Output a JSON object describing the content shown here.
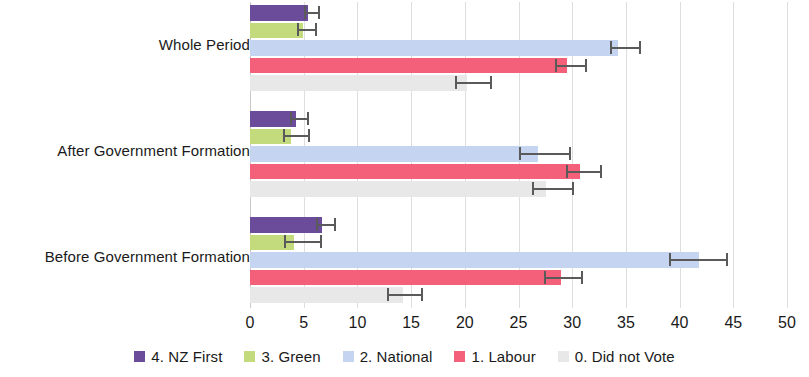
{
  "chart_data": {
    "type": "bar",
    "orientation": "horizontal",
    "title": "",
    "xlabel": "",
    "ylabel": "",
    "xlim": [
      0,
      50
    ],
    "ylim": null,
    "xticks": [
      0,
      5,
      10,
      15,
      20,
      25,
      30,
      35,
      40,
      45,
      50
    ],
    "xtick_labels": [
      "0",
      "5",
      "10",
      "15",
      "20",
      "25",
      "30",
      "35",
      "40",
      "45",
      "50"
    ],
    "grid": true,
    "grid_axis": "x",
    "legend_position": "bottom",
    "categories": [
      "Whole Period",
      "After Government Formation",
      "Before Government Formation"
    ],
    "series": [
      {
        "name": "4. NZ First",
        "color": "#6B4C9A",
        "values": [
          5.4,
          4.3,
          6.7
        ],
        "err_low": [
          5.0,
          3.7,
          6.1
        ],
        "err_high": [
          6.5,
          5.5,
          8.0
        ]
      },
      {
        "name": "3. Green",
        "color": "#C3DB7C",
        "values": [
          4.9,
          3.8,
          4.1
        ],
        "err_low": [
          4.4,
          3.1,
          3.2
        ],
        "err_high": [
          6.2,
          5.6,
          6.7
        ]
      },
      {
        "name": "2. National",
        "color": "#C5D4F0",
        "values": [
          34.3,
          26.8,
          41.8
        ],
        "err_low": [
          33.5,
          25.0,
          39.0
        ],
        "err_high": [
          36.4,
          29.9,
          44.5
        ]
      },
      {
        "name": "1. Labour",
        "color": "#F4607A",
        "values": [
          29.5,
          30.7,
          29.0
        ],
        "err_low": [
          28.4,
          29.4,
          27.4
        ],
        "err_high": [
          31.4,
          32.8,
          31.0
        ]
      },
      {
        "name": "0. Did not Vote",
        "color": "#E8E8E8",
        "values": [
          20.2,
          27.6,
          14.2
        ],
        "err_low": [
          19.1,
          26.3,
          12.8
        ],
        "err_high": [
          22.5,
          30.2,
          16.1
        ]
      }
    ]
  },
  "legend": {
    "items": [
      {
        "label": "4. NZ First",
        "swatch": "#6B4C9A"
      },
      {
        "label": "3. Green",
        "swatch": "#C3DB7C"
      },
      {
        "label": "2. National",
        "swatch": "#C5D4F0"
      },
      {
        "label": "1. Labour",
        "swatch": "#F4607A"
      },
      {
        "label": "0. Did not Vote",
        "swatch": "#E8E8E8"
      }
    ]
  }
}
